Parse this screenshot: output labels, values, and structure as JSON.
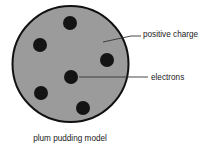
{
  "canvas": {
    "width": 218,
    "height": 149,
    "background": "#ffffff"
  },
  "diagram": {
    "title_caption": "plum pudding model",
    "sphere": {
      "name": "positive-charge-sphere",
      "cx": 70.5,
      "cy": 64,
      "r": 58,
      "fill": "#9b9b9b",
      "stroke": "#111111",
      "stroke_width": 2
    },
    "electrons": {
      "label": "electrons",
      "fill": "#141414",
      "r": 7,
      "points": [
        {
          "name": "electron-top",
          "cx": 70,
          "cy": 23
        },
        {
          "name": "electron-upper-left",
          "cx": 40,
          "cy": 45
        },
        {
          "name": "electron-right",
          "cx": 107,
          "cy": 60
        },
        {
          "name": "electron-center",
          "cx": 71,
          "cy": 77
        },
        {
          "name": "electron-lower-left",
          "cx": 41,
          "cy": 93
        },
        {
          "name": "electron-bottom",
          "cx": 83,
          "cy": 108
        }
      ]
    },
    "callouts": [
      {
        "name": "callout-positive-charge",
        "text": "positive charge",
        "text_x": 143,
        "text_y": 37,
        "leader_points": "103,42 131,36 141,36",
        "stroke": "#333333"
      },
      {
        "name": "callout-electrons",
        "text": "electrons",
        "text_x": 151,
        "text_y": 80,
        "leader_points": "79,77 148,77",
        "stroke": "#333333"
      }
    ],
    "caption": {
      "name": "diagram-caption",
      "text": "plum pudding model",
      "x": 70,
      "y": 141
    }
  }
}
